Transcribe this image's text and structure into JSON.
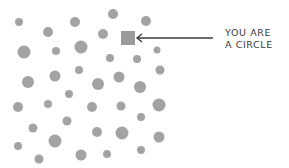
{
  "label": {
    "line1": "YOU ARE",
    "line2": "A CIRCLE"
  },
  "colors": {
    "circle_fill": "#a3a3a3",
    "square_fill": "#9a9a9a",
    "arrow": "#3a3a3a",
    "text": "#3a3a3a",
    "background": "#ffffff"
  },
  "highlighted_shape": {
    "type": "square",
    "x": 121,
    "y": 31,
    "size": 14
  },
  "arrow": {
    "x1": 213,
    "y1": 38,
    "x2": 137,
    "y2": 38
  },
  "circles": [
    {
      "cx": 19,
      "cy": 22,
      "r": 4
    },
    {
      "cx": 48,
      "cy": 32,
      "r": 5
    },
    {
      "cx": 75,
      "cy": 22,
      "r": 5
    },
    {
      "cx": 113,
      "cy": 14,
      "r": 5
    },
    {
      "cx": 146,
      "cy": 21,
      "r": 5
    },
    {
      "cx": 103,
      "cy": 34,
      "r": 5
    },
    {
      "cx": 24,
      "cy": 52,
      "r": 6.5
    },
    {
      "cx": 56,
      "cy": 51,
      "r": 4
    },
    {
      "cx": 81,
      "cy": 47,
      "r": 6.5
    },
    {
      "cx": 157,
      "cy": 50,
      "r": 3.5
    },
    {
      "cx": 110,
      "cy": 58,
      "r": 4
    },
    {
      "cx": 137,
      "cy": 59,
      "r": 4
    },
    {
      "cx": 28,
      "cy": 82,
      "r": 6
    },
    {
      "cx": 55,
      "cy": 76,
      "r": 5.5
    },
    {
      "cx": 79,
      "cy": 70,
      "r": 4
    },
    {
      "cx": 160,
      "cy": 70,
      "r": 4.5
    },
    {
      "cx": 98,
      "cy": 84,
      "r": 6
    },
    {
      "cx": 119,
      "cy": 77,
      "r": 5.5
    },
    {
      "cx": 140,
      "cy": 87,
      "r": 6
    },
    {
      "cx": 69,
      "cy": 94,
      "r": 4
    },
    {
      "cx": 18,
      "cy": 107,
      "r": 5
    },
    {
      "cx": 48,
      "cy": 104,
      "r": 4
    },
    {
      "cx": 92,
      "cy": 107,
      "r": 5
    },
    {
      "cx": 121,
      "cy": 106,
      "r": 4.5
    },
    {
      "cx": 159,
      "cy": 105,
      "r": 6.5
    },
    {
      "cx": 67,
      "cy": 121,
      "r": 4.5
    },
    {
      "cx": 141,
      "cy": 117,
      "r": 4
    },
    {
      "cx": 33,
      "cy": 128,
      "r": 4.5
    },
    {
      "cx": 97,
      "cy": 132,
      "r": 5
    },
    {
      "cx": 122,
      "cy": 133,
      "r": 6.5
    },
    {
      "cx": 159,
      "cy": 137,
      "r": 5.5
    },
    {
      "cx": 55,
      "cy": 141,
      "r": 6.5
    },
    {
      "cx": 18,
      "cy": 146,
      "r": 4
    },
    {
      "cx": 141,
      "cy": 150,
      "r": 4
    },
    {
      "cx": 81,
      "cy": 155,
      "r": 5.5
    },
    {
      "cx": 107,
      "cy": 154,
      "r": 4
    },
    {
      "cx": 39,
      "cy": 159,
      "r": 4.5
    }
  ]
}
